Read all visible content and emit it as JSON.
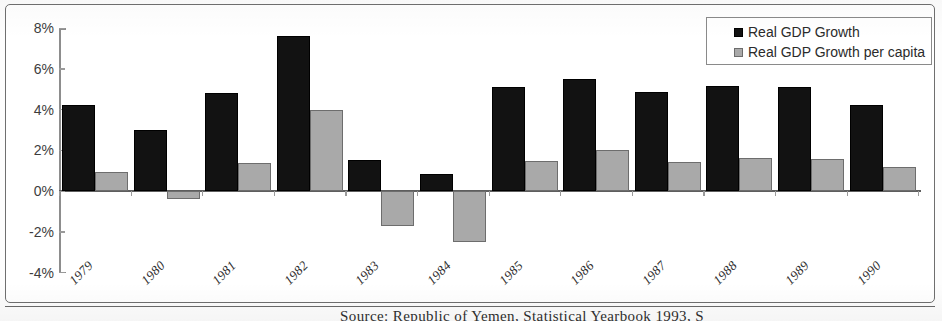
{
  "chart_data": {
    "type": "bar",
    "title": "",
    "xlabel": "",
    "ylabel": "",
    "ylim": [
      -4,
      8
    ],
    "ytick_labels": [
      "8%",
      "6%",
      "4%",
      "2%",
      "0%",
      "-2%",
      "-4%"
    ],
    "ytick_values": [
      8,
      6,
      4,
      2,
      0,
      -2,
      -4
    ],
    "grid": false,
    "legend_position": "top-right",
    "categories": [
      "1979",
      "1980",
      "1981",
      "1982",
      "1983",
      "1984",
      "1985",
      "1986",
      "1987",
      "1988",
      "1989",
      "1990"
    ],
    "series": [
      {
        "name": "Real GDP Growth",
        "color": "#121212",
        "values": [
          4.2,
          3.0,
          4.8,
          7.6,
          1.5,
          0.85,
          5.1,
          5.5,
          4.85,
          5.15,
          5.1,
          4.2
        ]
      },
      {
        "name": "Real GDP Growth per capita",
        "color": "#a9a9a9",
        "values": [
          0.95,
          -0.4,
          1.35,
          4.0,
          -1.7,
          -2.5,
          1.45,
          2.0,
          1.4,
          1.6,
          1.55,
          1.2
        ]
      }
    ]
  },
  "legend": {
    "items": [
      {
        "label": "Real GDP Growth"
      },
      {
        "label": "Real GDP Growth per capita"
      }
    ]
  },
  "caption": {
    "text": "Source:  Republic of Yemen,  Statistical Yearbook 1993, S"
  }
}
